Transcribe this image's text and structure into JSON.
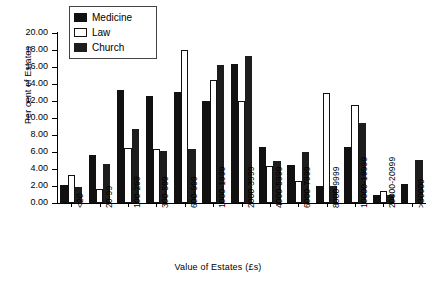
{
  "chart_data": {
    "type": "bar",
    "title": "",
    "xlabel": "Value of Estates (£s)",
    "ylabel": "Per cent of Estates",
    "ylim": [
      0,
      20
    ],
    "ytick_labels": [
      "0.00",
      "2.00",
      "4.00",
      "6.00",
      "8.00",
      "10.00",
      "12.00",
      "14.00",
      "16.00",
      "18.00",
      "20.00"
    ],
    "ytick_values": [
      0,
      2,
      4,
      6,
      8,
      10,
      12,
      14,
      16,
      18,
      20
    ],
    "grid": false,
    "legend_position": "top-left-inside",
    "categories": [
      "<20",
      "20-99",
      "100-299",
      "300-599",
      "600-999",
      "1000-1999",
      "2000-3999",
      "4000-5999",
      "6000-7999",
      "8000-9999",
      "10000-19999",
      "20000-20999",
      ">30000"
    ],
    "series": [
      {
        "name": "Medicine",
        "color": "#111111",
        "values": [
          2.1,
          5.6,
          13.3,
          12.6,
          13.1,
          12.0,
          16.3,
          6.6,
          4.5,
          2.0,
          6.6,
          1.0,
          2.2
        ]
      },
      {
        "name": "Law",
        "color": "#ffffff",
        "values": [
          3.3,
          1.6,
          6.5,
          6.4,
          18.0,
          14.5,
          12.0,
          4.4,
          2.6,
          13.0,
          11.5,
          1.4,
          0.0
        ]
      },
      {
        "name": "Church",
        "color": "#1d1d1d",
        "values": [
          1.9,
          4.6,
          8.7,
          6.1,
          6.3,
          16.2,
          17.3,
          5.0,
          6.0,
          2.0,
          9.4,
          1.0,
          5.1
        ]
      }
    ]
  },
  "legend": {
    "items": [
      {
        "label": "Medicine",
        "key": "medicine"
      },
      {
        "label": "Law",
        "key": "law"
      },
      {
        "label": "Church",
        "key": "church"
      }
    ]
  }
}
